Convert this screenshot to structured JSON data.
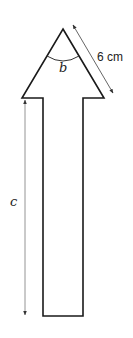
{
  "diagram": {
    "shape": "arrow",
    "labels": {
      "side_length": "6 cm",
      "apex_angle": "b",
      "shaft_length": "c"
    },
    "colors": {
      "outline": "#1a1a1a",
      "dimension_line": "#555555",
      "background": "#ffffff"
    },
    "geometry": {
      "apex": [
        63,
        29
      ],
      "head_left": [
        22,
        98
      ],
      "head_right": [
        104,
        98
      ],
      "shaft_left_x": 43,
      "shaft_right_x": 83,
      "shaft_bottom_y": 316
    }
  }
}
